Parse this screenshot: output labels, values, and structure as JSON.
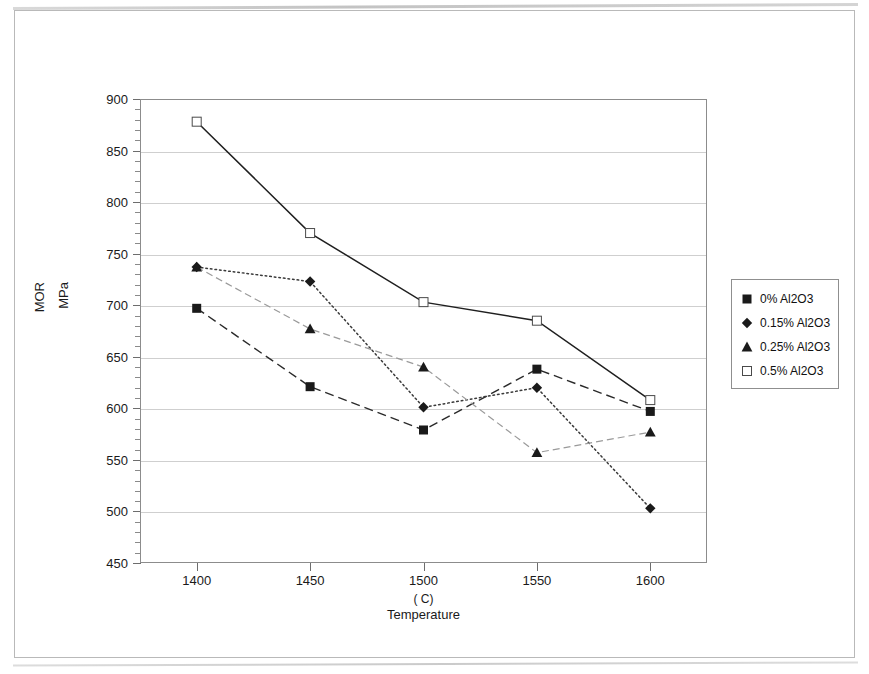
{
  "chart_data": {
    "type": "line",
    "title": "",
    "xlabel": "Temperature",
    "xunit": "( C)",
    "ylabel_line1": "MOR",
    "ylabel_line2": "MPa",
    "x": [
      1400,
      1450,
      1500,
      1550,
      1600
    ],
    "categories": [
      "1400",
      "1450",
      "1500",
      "1550",
      "1600"
    ],
    "xlim": [
      1375,
      1625
    ],
    "ylim": [
      450,
      900
    ],
    "ytick_labels": [
      "900",
      "850",
      "800",
      "750",
      "700",
      "650",
      "600",
      "550",
      "500",
      "450"
    ],
    "ytick_values": [
      900,
      850,
      800,
      750,
      700,
      650,
      600,
      550,
      500,
      450
    ],
    "ytick_step": 50,
    "yminor_step": 10,
    "grid": "horizontal",
    "legend_position": "right",
    "series": [
      {
        "name": "0% Al2O3",
        "marker": "filled-square",
        "linestyle": "dashed",
        "color": "#1a1a1a",
        "values": [
          697,
          621,
          579,
          638,
          597
        ]
      },
      {
        "name": "0.15% Al2O3",
        "marker": "filled-diamond",
        "linestyle": "dotted",
        "color": "#1a1a1a",
        "values": [
          737,
          723,
          601,
          620,
          503
        ]
      },
      {
        "name": "0.25% Al2O3",
        "marker": "filled-triangle",
        "linestyle": "dash-dot",
        "color": "#1a1a1a",
        "values": [
          737,
          677,
          640,
          557,
          577
        ]
      },
      {
        "name": "0.5% Al2O3",
        "marker": "open-square",
        "linestyle": "solid",
        "color": "#1a1a1a",
        "values": [
          878,
          770,
          703,
          685,
          608
        ]
      }
    ]
  },
  "legend": {
    "items": [
      {
        "label": "0% Al2O3",
        "marker": "filled-square"
      },
      {
        "label": "0.15% Al2O3",
        "marker": "filled-diamond"
      },
      {
        "label": "0.25% Al2O3",
        "marker": "filled-triangle"
      },
      {
        "label": "0.5% Al2O3",
        "marker": "open-square"
      }
    ]
  }
}
